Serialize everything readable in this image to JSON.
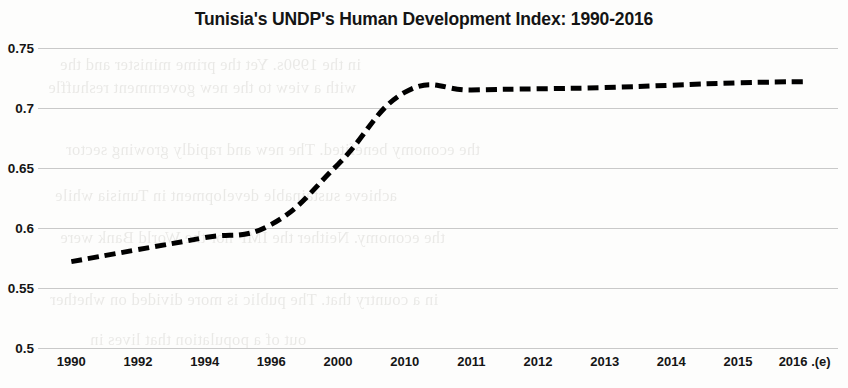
{
  "chart_data": {
    "type": "line",
    "title": "Tunisia's UNDP's Human Development Index: 1990-2016",
    "xlabel": "",
    "ylabel": "",
    "categories": [
      "1990",
      "1992",
      "1994",
      "1996",
      "2000",
      "2010",
      "2011",
      "2012",
      "2013",
      "2014",
      "2015",
      "2016 .(e)"
    ],
    "values": [
      0.572,
      0.582,
      0.592,
      0.603,
      0.653,
      0.713,
      0.715,
      0.716,
      0.717,
      0.719,
      0.721,
      0.722
    ],
    "series": [
      {
        "name": "Human Development Index",
        "values": [
          0.572,
          0.582,
          0.592,
          0.603,
          0.653,
          0.713,
          0.715,
          0.716,
          0.717,
          0.719,
          0.721,
          0.722
        ]
      }
    ],
    "ylim": [
      0.5,
      0.75
    ],
    "yticks": [
      0.75,
      0.7,
      0.65,
      0.6,
      0.55,
      0.5
    ],
    "ytick_labels": [
      "0.75",
      "0.7",
      "0.65",
      "0.6",
      "0.55",
      "0.5"
    ],
    "grid": true,
    "legend": false,
    "legend_position": "none",
    "line_style": "dashed",
    "line_color": "#000000",
    "line_width": 5,
    "markers": false
  },
  "colors": {
    "line": "#000000",
    "grid": "#c9c9c9",
    "text": "#151515",
    "background": "#fdfdfc"
  },
  "bleed_text": [
    "in the 1990s. Yet the prime minister and the",
    "with a view to the new government reshuffle",
    "the economy benefited. The new and rapidly growing sector",
    "achieve sustainable development in Tunisia while",
    "the economy. Neither the IMF nor the World Bank were",
    "in a country that. The public is more divided on whether",
    "out of a population that lives in"
  ]
}
